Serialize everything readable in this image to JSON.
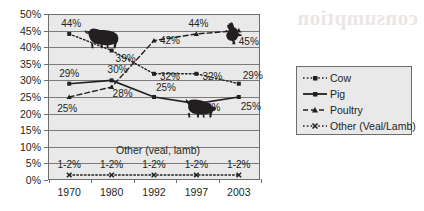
{
  "chart_data": {
    "type": "line",
    "title": "",
    "xlabel": "",
    "ylabel": "",
    "categories": [
      "1970",
      "1980",
      "1992",
      "1997",
      "2003"
    ],
    "ylim": [
      0,
      50
    ],
    "ytick_labels": [
      "0%",
      "5%",
      "10%",
      "15%",
      "20%",
      "25%",
      "30%",
      "35%",
      "40%",
      "45%",
      "50%"
    ],
    "ytick_values": [
      0,
      5,
      10,
      15,
      20,
      25,
      30,
      35,
      40,
      45,
      50
    ],
    "grid": true,
    "legend_position": "right",
    "series": [
      {
        "name": "Cow",
        "values": [
          44,
          39,
          32,
          32,
          29
        ],
        "point_labels": [
          "44%",
          "39%",
          "32%",
          "32%",
          "29%"
        ],
        "style": "dotted",
        "marker": "square"
      },
      {
        "name": "Pig",
        "values": [
          29,
          30,
          25,
          23,
          25
        ],
        "point_labels": [
          "29%",
          "30%",
          "25%",
          "23%",
          "25%"
        ],
        "style": "solid",
        "marker": "square"
      },
      {
        "name": "Poultry",
        "values": [
          25,
          28,
          42,
          44,
          45
        ],
        "point_labels": [
          "25%",
          "28%",
          "42%",
          "44%",
          "45%"
        ],
        "style": "dashed",
        "marker": "triangle"
      },
      {
        "name": "Other (Veal/Lamb)",
        "values": [
          1.5,
          1.5,
          1.5,
          1.5,
          1.5
        ],
        "point_labels": [
          "1-2%",
          "1-2%",
          "1-2%",
          "1-2%",
          "1-2%"
        ],
        "style": "dotted",
        "marker": "x"
      }
    ],
    "annotations": [
      {
        "text": "Other (veal, lamb)",
        "x": "1985",
        "y": 8
      }
    ]
  },
  "legend": {
    "items": [
      {
        "label": "Cow"
      },
      {
        "label": "Pig"
      },
      {
        "label": "Poultry"
      },
      {
        "label": "Other (Veal/Lamb)"
      }
    ]
  },
  "icons": {
    "cow": "cow-icon",
    "pig": "pig-icon",
    "rooster": "rooster-icon"
  },
  "colors": {
    "ink": "#231f20",
    "plot_background": "#e9e9e9",
    "grid": "#7a7a7a",
    "border": "#6d6d6d",
    "page_background": "#ffffff"
  },
  "bleed_text": {
    "line1": "consumption",
    "line2": ""
  }
}
